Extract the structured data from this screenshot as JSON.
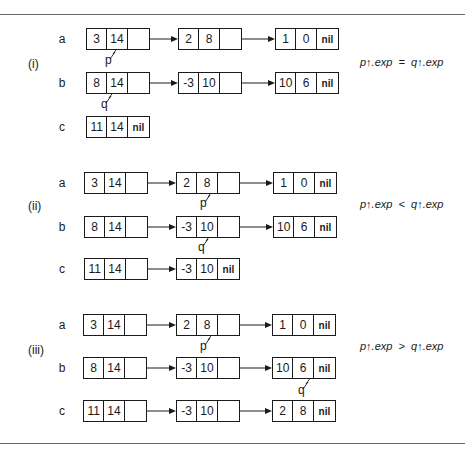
{
  "diagram": {
    "sections": [
      {
        "label": "(i)",
        "condition": "p↑.exp  =  q↑.exp",
        "rows": [
          {
            "name": "a",
            "nodes": [
              [
                "3",
                "14",
                ""
              ],
              [
                "2",
                "8",
                ""
              ],
              [
                "1",
                "0",
                "nil"
              ]
            ]
          },
          {
            "name": "b",
            "nodes": [
              [
                "8",
                "14",
                ""
              ],
              [
                "-3",
                "10",
                ""
              ],
              [
                "10",
                "6",
                "nil"
              ]
            ]
          },
          {
            "name": "c",
            "nodes": [
              [
                "11",
                "14",
                "nil"
              ]
            ]
          }
        ],
        "pointers": [
          {
            "label": "p",
            "row": "a",
            "node_index": 0
          },
          {
            "label": "q",
            "row": "b",
            "node_index": 0
          }
        ]
      },
      {
        "label": "(ii)",
        "condition": "p↑.exp  <  q↑.exp",
        "rows": [
          {
            "name": "a",
            "nodes": [
              [
                "3",
                "14",
                ""
              ],
              [
                "2",
                "8",
                ""
              ],
              [
                "1",
                "0",
                "nil"
              ]
            ]
          },
          {
            "name": "b",
            "nodes": [
              [
                "8",
                "14",
                ""
              ],
              [
                "-3",
                "10",
                ""
              ],
              [
                "10",
                "6",
                "nil"
              ]
            ]
          },
          {
            "name": "c",
            "nodes": [
              [
                "11",
                "14",
                ""
              ],
              [
                "-3",
                "10",
                "nil"
              ]
            ]
          }
        ],
        "pointers": [
          {
            "label": "p",
            "row": "a",
            "node_index": 1
          },
          {
            "label": "q",
            "row": "b",
            "node_index": 1
          }
        ]
      },
      {
        "label": "(iii)",
        "condition": "p↑.exp  >  q↑.exp",
        "rows": [
          {
            "name": "a",
            "nodes": [
              [
                "3",
                "14",
                ""
              ],
              [
                "2",
                "8",
                ""
              ],
              [
                "1",
                "0",
                "nil"
              ]
            ]
          },
          {
            "name": "b",
            "nodes": [
              [
                "8",
                "14",
                ""
              ],
              [
                "-3",
                "10",
                ""
              ],
              [
                "10",
                "6",
                "nil"
              ]
            ]
          },
          {
            "name": "c",
            "nodes": [
              [
                "11",
                "14",
                ""
              ],
              [
                "-3",
                "10",
                ""
              ],
              [
                "2",
                "8",
                "nil"
              ]
            ]
          }
        ],
        "pointers": [
          {
            "label": "p",
            "row": "a",
            "node_index": 1
          },
          {
            "label": "q",
            "row": "b",
            "node_index": 2
          }
        ]
      }
    ]
  }
}
